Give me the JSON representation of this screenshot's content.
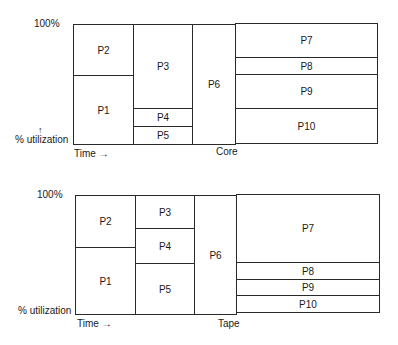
{
  "diagrams": [
    {
      "id": "core",
      "resource_label": "Core",
      "y_top_label": "100%",
      "y_arrow": "↑",
      "y_axis_label": "% utilization",
      "x_axis_label": "Time →",
      "blocks": [
        {
          "label": "P2",
          "x": 73,
          "y": 24,
          "w": 61,
          "h": 52
        },
        {
          "label": "P1",
          "x": 73,
          "y": 75,
          "w": 61,
          "h": 70
        },
        {
          "label": "P3",
          "x": 133,
          "y": 24,
          "w": 60,
          "h": 85
        },
        {
          "label": "P4",
          "x": 133,
          "y": 108,
          "w": 60,
          "h": 19
        },
        {
          "label": "P5",
          "x": 133,
          "y": 126,
          "w": 60,
          "h": 19
        },
        {
          "label": "P6",
          "x": 192,
          "y": 24,
          "w": 44,
          "h": 121
        },
        {
          "label": "P7",
          "x": 235,
          "y": 23,
          "w": 143,
          "h": 35
        },
        {
          "label": "P8",
          "x": 235,
          "y": 57,
          "w": 143,
          "h": 18
        },
        {
          "label": "P9",
          "x": 235,
          "y": 74,
          "w": 143,
          "h": 35
        },
        {
          "label": "P10",
          "x": 235,
          "y": 108,
          "w": 143,
          "h": 36
        }
      ]
    },
    {
      "id": "tape",
      "resource_label": "Tape",
      "y_top_label": "100%",
      "y_axis_label": "% utilization",
      "x_axis_label": "Time →",
      "blocks": [
        {
          "label": "P2",
          "x": 75,
          "y": 195,
          "w": 61,
          "h": 53
        },
        {
          "label": "P1",
          "x": 75,
          "y": 247,
          "w": 61,
          "h": 68
        },
        {
          "label": "P3",
          "x": 135,
          "y": 195,
          "w": 60,
          "h": 34
        },
        {
          "label": "P4",
          "x": 135,
          "y": 228,
          "w": 60,
          "h": 36
        },
        {
          "label": "P5",
          "x": 135,
          "y": 263,
          "w": 60,
          "h": 52
        },
        {
          "label": "P6",
          "x": 194,
          "y": 195,
          "w": 43,
          "h": 120
        },
        {
          "label": "P7",
          "x": 236,
          "y": 194,
          "w": 144,
          "h": 69
        },
        {
          "label": "P8",
          "x": 236,
          "y": 262,
          "w": 144,
          "h": 18
        },
        {
          "label": "P9",
          "x": 236,
          "y": 279,
          "w": 144,
          "h": 17
        },
        {
          "label": "P10",
          "x": 236,
          "y": 295,
          "w": 144,
          "h": 18
        }
      ]
    }
  ]
}
